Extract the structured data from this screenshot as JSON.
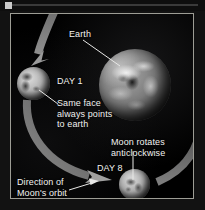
{
  "figure": {
    "title_text": "Earth-Moon tidal locking diagram",
    "background_color": "#000000",
    "frame_color": "#9d9d95",
    "label_color": "#f2f2f0",
    "arrow_color": "#8a8a8a"
  },
  "top_strip": {
    "handle_name": "drag-handle",
    "rule_name": "divider-rule"
  },
  "bodies": {
    "earth": {
      "name": "Earth",
      "label": "Earth"
    },
    "moon_day1": {
      "name": "Moon at Day 1",
      "label": "DAY 1"
    },
    "moon_day8": {
      "name": "Moon at Day 8",
      "label": "DAY 8"
    }
  },
  "labels": {
    "earth": "Earth",
    "day1": "DAY 1",
    "same_face": "Same face\nalways points\nto earth",
    "moon_rotates": "Moon rotates\nanticlockwise",
    "day8": "DAY 8",
    "direction": "Direction of\nMoon's orbit"
  },
  "annotations": {
    "earth_leader": "leader line from Earth label to Earth sphere",
    "same_face_leader": "leader line from Same face text to Day 1 Moon",
    "rotates_leader": "leader line from Moon rotates text to Day 8 Moon",
    "direction_leader": "arrow from Direction of Moon's orbit text to orbit arc"
  },
  "orbit": {
    "description": "large grey curved arrow showing anticlockwise lunar orbit around Earth",
    "arrowheads": [
      "top-left pointing down-left",
      "bottom-centre pointing right"
    ]
  }
}
